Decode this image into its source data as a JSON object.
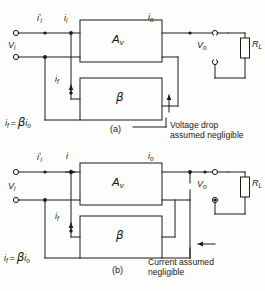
{
  "figure": {
    "line_color": "#1b1b1b",
    "background": "#fdfdfc"
  },
  "diagram_a": {
    "caption": "(a)",
    "blocks": [
      {
        "name": "forward-amplifier-block",
        "label_base": "A",
        "label_sub": "v"
      },
      {
        "name": "feedback-network-block",
        "label_base": "β",
        "label_sub": ""
      }
    ],
    "labels": {
      "input_current_prime": {
        "base": "i",
        "prime": "′",
        "sub": "i"
      },
      "input_current": {
        "base": "i",
        "prime": "",
        "sub": "i"
      },
      "output_current": {
        "base": "i",
        "prime": "",
        "sub": "o"
      },
      "input_voltage": {
        "base": "V",
        "prime": "",
        "sub": "i"
      },
      "output_voltage": {
        "base": "V",
        "prime": "",
        "sub": "o"
      },
      "load_resistor": {
        "base": "R",
        "prime": "",
        "sub": "L"
      },
      "feedback_current": {
        "base": "i",
        "prime": "",
        "sub": "f"
      },
      "feedback_equation": "i_f = βi_o"
    },
    "annotation": {
      "line1": "Voltage drop",
      "line2": "assumed negligible",
      "arrow_direction": "up"
    }
  },
  "diagram_b": {
    "caption": "(b)",
    "blocks": [
      {
        "name": "forward-amplifier-block",
        "label_base": "A",
        "label_sub": "v"
      },
      {
        "name": "feedback-network-block",
        "label_base": "β",
        "label_sub": ""
      }
    ],
    "labels": {
      "input_current_prime": {
        "base": "i",
        "prime": "′",
        "sub": "i"
      },
      "input_current": {
        "base": "i",
        "prime": "",
        "sub": ""
      },
      "output_current": {
        "base": "i",
        "prime": "",
        "sub": "o"
      },
      "input_voltage": {
        "base": "V",
        "prime": "",
        "sub": "i"
      },
      "output_voltage": {
        "base": "V",
        "prime": "",
        "sub": "o"
      },
      "load_resistor": {
        "base": "R",
        "prime": "",
        "sub": "L"
      },
      "feedback_current": {
        "base": "i",
        "prime": "",
        "sub": "f"
      },
      "feedback_equation": "i_f = βi_o"
    },
    "annotation": {
      "line1": "Current assumed",
      "line2": "negligible",
      "arrow_direction": "left"
    }
  }
}
